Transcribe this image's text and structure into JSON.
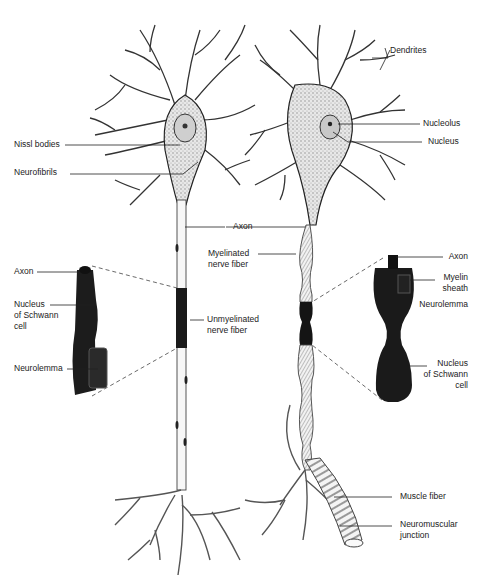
{
  "diagram": {
    "labels": {
      "dendrites": "Dendrites",
      "nucleolus": "Nucleolus",
      "nucleus": "Nucleus",
      "nissl_bodies": "Nissl bodies",
      "neurofibrils": "Neurofibrils",
      "axon_center": "Axon",
      "myelinated_fiber": "Myelinated\nnerve fiber",
      "unmyelinated_fiber": "Unmyelinated\nnerve fiber",
      "left_axon": "Axon",
      "left_schwann_nucleus": "Nucleus\nof Schwann\ncell",
      "left_neurolemma": "Neurolemma",
      "right_axon": "Axon",
      "right_myelin_sheath": "Myelin\nsheath",
      "right_neurolemma": "Neurolemma",
      "right_schwann_nucleus": "Nucleus\nof Schwann\ncell",
      "muscle_fiber": "Muscle fiber",
      "neuromuscular_junction": "Neuromuscular\njunction"
    }
  }
}
